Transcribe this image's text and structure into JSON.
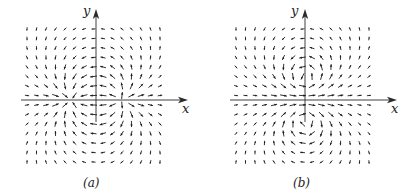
{
  "figure": {
    "panels": [
      {
        "id": "a",
        "caption": "(a)",
        "x_axis_label": "x",
        "y_axis_label": "y",
        "origin": [
          96,
          100
        ],
        "field_type": "source-sink dipole",
        "singularities": [
          {
            "kind": "source",
            "pos": [
              121,
              100
            ]
          },
          {
            "kind": "sink",
            "pos": [
              72,
              100
            ]
          }
        ]
      },
      {
        "id": "b",
        "caption": "(b)",
        "x_axis_label": "x",
        "y_axis_label": "y",
        "origin": [
          305,
          100
        ],
        "field_type": "vortex pair",
        "singularities": [
          {
            "kind": "vortex-ccw",
            "pos": [
              305,
              78
            ]
          },
          {
            "kind": "vortex-cw",
            "pos": [
              305,
              121
            ]
          }
        ]
      }
    ],
    "grid": {
      "spacing": 9.5,
      "x_offsets_min": -69,
      "x_offsets_max": 69,
      "y_min": 29,
      "y_max": 171
    },
    "colors": {
      "ink": "#1a1a1a",
      "axis": "#2a2a2a"
    }
  }
}
